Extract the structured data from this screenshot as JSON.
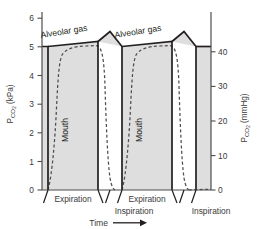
{
  "chart_data": {
    "type": "line",
    "title": "",
    "subtitle": "",
    "grid": false,
    "legend_position": "inline-annotation",
    "axes": {
      "left": {
        "label": "Pco2 (kPa)",
        "label_main": "P",
        "label_sub": "CO",
        "label_sub2": "2",
        "label_unit": " (kPa)",
        "ticks": [
          0,
          1,
          2,
          3,
          4,
          5,
          6
        ],
        "ticklabels": [
          "0",
          "1",
          "2",
          "3",
          "4",
          "5",
          "6"
        ],
        "lim": [
          0,
          6.6
        ]
      },
      "right": {
        "label": "Pco2 (mmHg)",
        "label_main": "P",
        "label_sub": "CO",
        "label_sub2": "2",
        "label_unit": " (mmHg)",
        "ticks": [
          0,
          10,
          20,
          30,
          40
        ],
        "ticklabels": [
          "0",
          "10",
          "20",
          "30",
          "40"
        ],
        "lim": [
          0,
          49.5
        ]
      },
      "x": {
        "label": "Time",
        "arrow": "⟶",
        "ticks": [],
        "ticklabels": []
      }
    },
    "annotations": [
      {
        "name": "alveolar-gas-label-1",
        "text": "Alveolar gas",
        "x": 0.16,
        "y": 5.85,
        "rotation": -9
      },
      {
        "name": "alveolar-gas-label-2",
        "text": "Alveolar gas",
        "x": 0.56,
        "y": 5.85,
        "rotation": -9
      },
      {
        "name": "mouth-label-1",
        "text": "Mouth",
        "x": 0.27,
        "y": 2.7,
        "rotation": -90
      },
      {
        "name": "mouth-label-2",
        "text": "Mouth",
        "x": 0.67,
        "y": 2.7,
        "rotation": -90
      }
    ],
    "phase_labels": [
      {
        "name": "expiration-1",
        "text": "Expiration"
      },
      {
        "name": "inspiration-1",
        "text": "Inspiration"
      },
      {
        "name": "expiration-2",
        "text": "Expiration"
      },
      {
        "name": "inspiration-2",
        "text": "Inspiration"
      }
    ],
    "series": [
      {
        "name": "Alveolar gas",
        "style": "solid",
        "color": "#231f20",
        "comment": "Near-square wave: plateau about 5.1-5.5 kPa during expiration, vertical drop to 0 at inspiration start, flat 0 during inspiration, vertical rise at expiration start"
      },
      {
        "name": "Mouth",
        "style": "dashed",
        "color": "#4d4d4d",
        "comment": "Rounded capnogram: rises from 0 with an S-shaped upstroke to a near plateau just under the alveolar level, then falls steeply back to 0 at inspiration"
      }
    ],
    "shading": {
      "name": "alveolar-shaded-region",
      "color": "#dedede",
      "comment": "Grey fill between the alveolar gas trace and the baseline"
    },
    "colors": {
      "background": "#ffffff",
      "plot_fill": "#dedede",
      "solid_line": "#231f20",
      "dashed_line": "#4d4d4d",
      "axis": "#4d4d4d",
      "text": "#3b3b3b"
    }
  }
}
